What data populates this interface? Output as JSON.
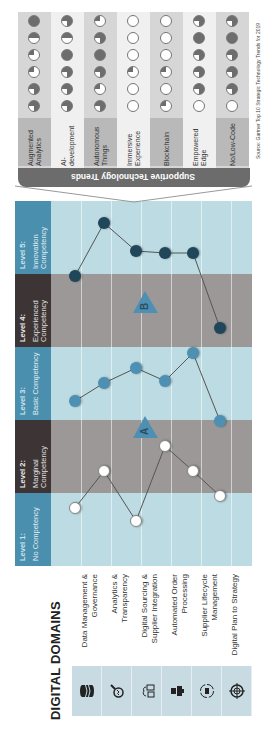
{
  "title": "DIGITAL DOMAINS",
  "domains": [
    {
      "label": "Data Management & Governance",
      "icon": "database-icon"
    },
    {
      "label": "Analytics & Transparency",
      "icon": "magnifier-chart-icon"
    },
    {
      "label": "Digital Sourcing & Supplier Integration",
      "icon": "cloud-devices-icon"
    },
    {
      "label": "Automated Order Processing",
      "icon": "robot-icon"
    },
    {
      "label": "Supplier Lifecycle Management",
      "icon": "cycle-truck-icon"
    },
    {
      "label": "Digital Plan to Strategy",
      "icon": "target-icon"
    }
  ],
  "levels": [
    {
      "title": "Level 1:",
      "sub": "No Competency"
    },
    {
      "title": "Level 2:",
      "sub": "Marginal Competency"
    },
    {
      "title": "Level 3:",
      "sub": "Basic Competency"
    },
    {
      "title": "Level 4:",
      "sub": "Experienced Competency"
    },
    {
      "title": "Level 5:",
      "sub": "Innovation Competency"
    }
  ],
  "markers": {
    "a": "A",
    "b": "B"
  },
  "chart_data": {
    "type": "line",
    "categories": [
      "Data Management & Governance",
      "Analytics & Transparency",
      "Digital Sourcing & Supplier Integration",
      "Automated Order Processing",
      "Supplier Lifecycle Management",
      "Digital Plan to Strategy"
    ],
    "y_labels": [
      "No Competency",
      "Marginal Competency",
      "Basic Competency",
      "Experienced Competency",
      "Innovation Competency"
    ],
    "series": [
      {
        "name": "A (current)",
        "values": [
          1.8,
          2.3,
          1.2,
          2.7,
          2.3,
          1.5
        ]
      },
      {
        "name": "Mid",
        "values": [
          3.0,
          3.4,
          3.6,
          3.4,
          3.8,
          2.6
        ]
      },
      {
        "name": "B (target)",
        "values": [
          4.9,
          5.4,
          5.1,
          5.0,
          5.0,
          4.0
        ]
      }
    ]
  },
  "trends": {
    "title": "Supportive Technology Trends",
    "source": "Source: Gartner Top 10 Strategic Technology Trends for 2019",
    "items": [
      "Augmented Analytics",
      "AI-development",
      "Autonomous Things",
      "Immersive Experience",
      "Blockchain",
      "Empowered Edge",
      "No/Low-Code"
    ],
    "ratings": [
      [
        0.75,
        0.75,
        0.25,
        0.25,
        0.5,
        1
      ],
      [
        0.75,
        0.75,
        0.75,
        1,
        0.5,
        0.75
      ],
      [
        0.75,
        0.25,
        0.75,
        1,
        0.75,
        0.25
      ],
      [
        0,
        0,
        0.25,
        0,
        0,
        0
      ],
      [
        0.25,
        0,
        0.25,
        0,
        0,
        0
      ],
      [
        0,
        0.75,
        0.75,
        0.75,
        1,
        0.75
      ],
      [
        0,
        0.75,
        0.75,
        0.75,
        1,
        0.75
      ]
    ],
    "colors": {
      "fill": "#6d6d6d",
      "empty": "#ffffff"
    }
  }
}
